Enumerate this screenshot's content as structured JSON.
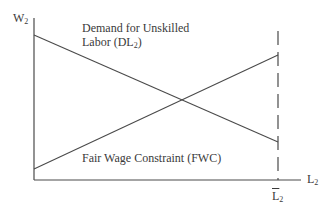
{
  "diagram": {
    "type": "economics-line-diagram",
    "colors": {
      "line": "#4a4a4a",
      "text": "#3a3a3a",
      "background": "#ffffff"
    },
    "axes": {
      "y_label": {
        "base": "W",
        "sub": "2"
      },
      "x_label": {
        "base": "L",
        "sub": "2"
      },
      "x_bar_label": {
        "base": "L",
        "sub": "2"
      }
    },
    "curves": [
      {
        "id": "DL2",
        "line1": "Demand for Unskilled",
        "line2_base": "Labor (DL",
        "line2_sub": "2",
        "line2_end": ")",
        "direction": "downward-sloping"
      },
      {
        "id": "FWC",
        "label": "Fair Wage Constraint (FWC)",
        "direction": "upward-sloping"
      }
    ],
    "vertical_marker": {
      "style": "dashed",
      "at": "L-bar-2"
    }
  }
}
